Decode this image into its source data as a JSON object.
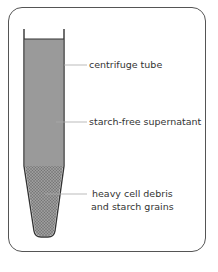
{
  "diagram": {
    "type": "centrifuge-tube-illustration",
    "labels": {
      "tube": "centrifuge tube",
      "supernatant": "starch-free supernatant",
      "pellet_line1": "heavy cell debris",
      "pellet_line2": "and starch grains"
    },
    "colors": {
      "frame_border": "#555555",
      "tube_outline": "#333333",
      "supernatant_fill": "#9a9a9a",
      "pellet_fill": "#8a8a8a",
      "leader_line": "#aaaaaa",
      "label_text": "#333333"
    }
  }
}
